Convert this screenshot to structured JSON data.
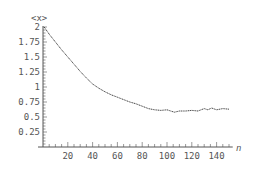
{
  "chart_data": {
    "type": "line",
    "title": "",
    "xlabel": "n",
    "ylabel": "<x>",
    "xlim": [
      0,
      155
    ],
    "ylim": [
      0,
      2
    ],
    "grid": false,
    "legend": null,
    "x_ticks": [
      20,
      40,
      60,
      80,
      100,
      120,
      140
    ],
    "x_tick_labels": [
      "20",
      "40",
      "60",
      "80",
      "100",
      "120",
      "140"
    ],
    "y_ticks": [
      0.25,
      0.5,
      0.75,
      1,
      1.25,
      1.5,
      1.75,
      2
    ],
    "y_tick_labels": [
      "0.25",
      "0.5",
      "0.75",
      "1",
      "1.25",
      "1.5",
      "1.75",
      "2"
    ],
    "series": [
      {
        "name": "<x>",
        "color": "#333333",
        "x": [
          1,
          5,
          10,
          15,
          20,
          25,
          30,
          35,
          40,
          45,
          50,
          55,
          60,
          65,
          70,
          75,
          80,
          85,
          90,
          95,
          100,
          103,
          106,
          110,
          115,
          120,
          125,
          130,
          133,
          136,
          140,
          145,
          150
        ],
        "values": [
          2.0,
          1.88,
          1.75,
          1.62,
          1.5,
          1.38,
          1.26,
          1.15,
          1.05,
          0.98,
          0.92,
          0.87,
          0.83,
          0.79,
          0.75,
          0.72,
          0.68,
          0.64,
          0.62,
          0.61,
          0.62,
          0.6,
          0.58,
          0.6,
          0.6,
          0.61,
          0.6,
          0.64,
          0.62,
          0.65,
          0.62,
          0.64,
          0.63
        ]
      }
    ]
  }
}
